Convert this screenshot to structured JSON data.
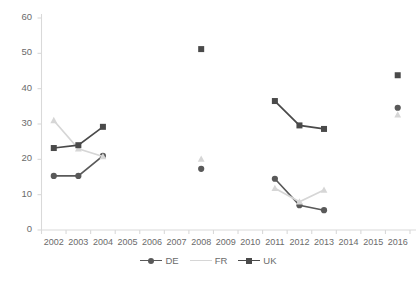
{
  "chart_data": {
    "type": "line",
    "title": "",
    "xlabel": "",
    "ylabel": "",
    "ylim": [
      0,
      60
    ],
    "ytick_step": 10,
    "yticks": [
      "0",
      "10",
      "20",
      "30",
      "40",
      "50",
      "60"
    ],
    "grid": false,
    "legend_position": "bottom",
    "categories": [
      "2002",
      "2003",
      "2004",
      "2005",
      "2006",
      "2007",
      "2008",
      "2009",
      "2010",
      "2011",
      "2012",
      "2013",
      "2014",
      "2015",
      "2016"
    ],
    "series": [
      {
        "name": "DE",
        "color": "#595959",
        "marker": "circle",
        "values": [
          15.3,
          15.3,
          21.0,
          null,
          null,
          null,
          17.3,
          null,
          null,
          14.5,
          7.0,
          5.6,
          null,
          null,
          34.6
        ]
      },
      {
        "name": "FR",
        "color": "#d6d6d6",
        "marker": "triangle",
        "values": [
          31.0,
          23.0,
          20.8,
          null,
          null,
          null,
          20.1,
          null,
          null,
          11.8,
          8.0,
          11.3,
          null,
          null,
          32.6
        ]
      },
      {
        "name": "UK",
        "color": "#4a4a4a",
        "marker": "square",
        "values": [
          23.2,
          24.0,
          29.2,
          null,
          null,
          null,
          51.2,
          null,
          null,
          36.5,
          29.6,
          28.6,
          null,
          null,
          43.8
        ]
      }
    ]
  },
  "legend": {
    "items": [
      {
        "label": "DE"
      },
      {
        "label": "FR"
      },
      {
        "label": "UK"
      }
    ]
  },
  "colors": {
    "de": "#595959",
    "fr": "#d6d6d6",
    "uk": "#4a4a4a",
    "axis": "#d9d9d9",
    "tick_text": "#6b6b6b"
  }
}
